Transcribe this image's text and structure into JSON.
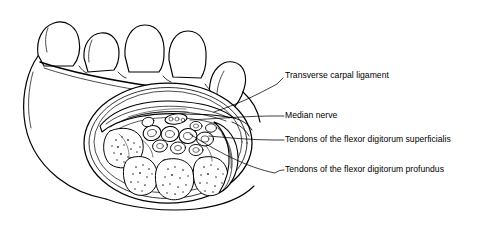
{
  "figure": {
    "view": "palmar view of hand with transverse section through the carpal tunnel",
    "background_color": "#ffffff",
    "ink_color": "#000000",
    "width": 502,
    "height": 229
  },
  "labels": [
    {
      "id": "transverse-carpal-ligament",
      "text": "Transverse carpal ligament",
      "text_x": 285,
      "text_y": 77,
      "leader": "M 277 84 L 283 78",
      "leader_long": "M 277 84 C 255 96 238 104 214 112"
    },
    {
      "id": "median-nerve",
      "text": "Median nerve",
      "text_x": 285,
      "text_y": 112,
      "leader": "M 275 116 L 284 116",
      "leader_long": "M 275 116 C 250 116 228 118 196 122"
    },
    {
      "id": "tendons-flexor-digitorum-superficialis",
      "text": "Tendons of the flexor digitorum superficialis",
      "text_x": 285,
      "text_y": 136,
      "leader": "M 275 140 L 284 140",
      "leader_long": "M 275 140 C 252 140 230 138 205 135"
    },
    {
      "id": "tendons-flexor-digitorum-profundus",
      "text": "Tendons of the flexor digitorum profundus",
      "text_x": 285,
      "text_y": 169,
      "leader": "M 275 173 C 278 171 280 170 284 170",
      "leader_long": "M 275 173 C 248 168 215 152 186 136"
    }
  ],
  "structures": [
    {
      "id": "hand-outline",
      "name": "hand and wrist outline"
    },
    {
      "id": "finger-1",
      "name": "thumb tip"
    },
    {
      "id": "finger-2",
      "name": "index finger tip"
    },
    {
      "id": "finger-3",
      "name": "middle finger tip"
    },
    {
      "id": "finger-4",
      "name": "ring finger tip"
    },
    {
      "id": "finger-5",
      "name": "little finger tip"
    },
    {
      "id": "carpal-section-rim",
      "name": "cut surface rim of the wrist section"
    },
    {
      "id": "transverse-carpal-ligament-band",
      "name": "transverse carpal ligament (flexor retinaculum)"
    },
    {
      "id": "median-nerve-body",
      "name": "median nerve, flattened beneath the retinaculum"
    },
    {
      "id": "superficialis-tendon-group",
      "name": "flexor digitorum superficialis tendons"
    },
    {
      "id": "profundus-tendon-group",
      "name": "flexor digitorum profundus tendons"
    },
    {
      "id": "thenar-muscle-mass",
      "name": "thenar muscle mass"
    },
    {
      "id": "hypothenar-muscle-mass",
      "name": "hypothenar muscle mass"
    },
    {
      "id": "carpal-bone-group",
      "name": "carpal bones forming the floor of the tunnel"
    }
  ]
}
